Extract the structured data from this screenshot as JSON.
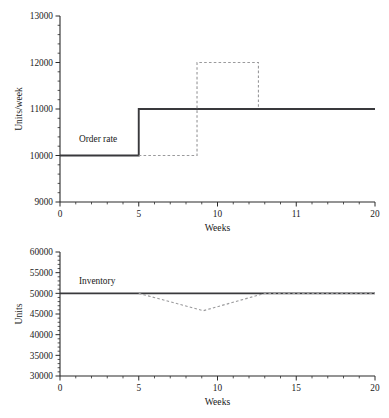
{
  "chart_data": [
    {
      "type": "line",
      "title": "",
      "xlabel": "Weeks",
      "ylabel": "Units/week",
      "xlim": [
        0,
        20
      ],
      "ylim": [
        9000,
        13000
      ],
      "grid": false,
      "legend": "inline-annotation",
      "xticks": [
        0,
        5,
        10,
        15,
        20
      ],
      "xticklabels": [
        "0",
        "5",
        "10",
        "11",
        "20"
      ],
      "yticks": [
        9000,
        10000,
        11000,
        12000,
        13000
      ],
      "yticklabels": [
        "9000",
        "10000",
        "11000",
        "12000",
        "13000"
      ],
      "minor_ticks": true,
      "series": [
        {
          "name": "Order rate",
          "style": "solid",
          "color": "#39393c",
          "annotation": "Order rate",
          "annotation_x": 1.2,
          "annotation_y": 10300,
          "x": [
            0,
            5,
            5,
            20
          ],
          "y": [
            10000,
            10000,
            11000,
            11000
          ]
        },
        {
          "name": "Order rate pulse",
          "style": "dashed",
          "color": "#9a9a9c",
          "x": [
            5,
            8.7,
            8.7,
            12.6,
            12.6
          ],
          "y": [
            10000,
            10000,
            12000,
            12000,
            11000
          ]
        }
      ]
    },
    {
      "type": "line",
      "title": "",
      "xlabel": "Weeks",
      "ylabel": "Units",
      "xlim": [
        0,
        20
      ],
      "ylim": [
        30000,
        60000
      ],
      "grid": false,
      "legend": "inline-annotation",
      "xticks": [
        0,
        5,
        10,
        15,
        20
      ],
      "xticklabels": [
        "0",
        "5",
        "10",
        "15",
        "20"
      ],
      "yticks": [
        30000,
        35000,
        40000,
        45000,
        50000,
        55000,
        60000
      ],
      "yticklabels": [
        "30000",
        "35000",
        "40000",
        "45000",
        "50000",
        "55000",
        "60000"
      ],
      "minor_ticks": true,
      "series": [
        {
          "name": "Inventory",
          "style": "solid",
          "color": "#39393c",
          "annotation": "Inventory",
          "annotation_x": 1.2,
          "annotation_y": 52200,
          "x": [
            0,
            20
          ],
          "y": [
            50000,
            50000
          ]
        },
        {
          "name": "Inventory dip",
          "style": "dashed",
          "color": "#9a9a9c",
          "x": [
            5,
            9.1,
            13.0,
            20
          ],
          "y": [
            50000,
            45800,
            50000,
            50000
          ]
        }
      ]
    }
  ]
}
